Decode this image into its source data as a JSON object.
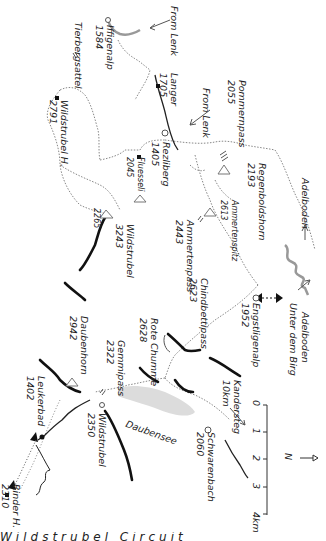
{
  "map": {
    "orientation": "rotated 90deg clockwise (north to the right)",
    "places": [
      {
        "name": "Iffigenalp",
        "elevation": "1584",
        "x": 118,
        "y": 25
      },
      {
        "name": "Langer",
        "elevation": "1705",
        "x": 178,
        "y": 74
      },
      {
        "name": "Tierbergsattel",
        "elevation": "",
        "x": 83,
        "y": 22
      },
      {
        "name": "Wildstrubel H.",
        "elevation": "2791",
        "x": 67,
        "y": 100
      },
      {
        "name": "Rezliberg",
        "elevation": "1405",
        "x": 170,
        "y": 144
      },
      {
        "name": "Fluesseli",
        "elevation": "2045",
        "x": 141,
        "y": 157
      },
      {
        "name": "Pommernpass",
        "elevation": "2055",
        "x": 246,
        "y": 80
      },
      {
        "name": "Regenboldshorn",
        "elevation": "2193",
        "x": 264,
        "y": 163
      },
      {
        "name": "Ammertenspitz",
        "elevation": "2613",
        "x": 240,
        "y": 198
      },
      {
        "name": "Ammertenpass",
        "elevation": "2443",
        "x": 196,
        "y": 218
      },
      {
        "name": "Wildstrubel",
        "elevation": "3243",
        "x": 135,
        "y": 225
      },
      {
        "name": "Chindbettipass",
        "elevation": "2623",
        "x": 205,
        "y": 278
      },
      {
        "name": "Rote Chumme",
        "elevation": "2628",
        "x": 163,
        "y": 322
      },
      {
        "name": "Engstligenalp",
        "elevation": "1952",
        "x": 263,
        "y": 297
      },
      {
        "name": "Unter dem Birg",
        "elevation": "",
        "x": 299,
        "y": 296
      },
      {
        "name": "Daubenhorn",
        "elevation": "2942",
        "x": 90,
        "y": 318
      },
      {
        "name": "Gemmipass",
        "elevation": "2322",
        "x": 127,
        "y": 340
      },
      {
        "name": "Leukerbad",
        "elevation": "1402",
        "x": 43,
        "y": 378
      },
      {
        "name": "Wildstrubel",
        "elevation": "2350",
        "x": 101,
        "y": 408
      },
      {
        "name": "Daubensee",
        "elevation": "",
        "x": 123,
        "y": 420
      },
      {
        "name": "Schwarenbach",
        "elevation": "2060",
        "x": 215,
        "y": 432
      },
      {
        "name": "Rinder H.",
        "elevation": "2310",
        "x": 20,
        "y": 485
      },
      {
        "name": "2265",
        "elevation": "",
        "x": 98,
        "y": 155
      }
    ],
    "directions": [
      {
        "label": "From Lenk",
        "x": 163,
        "y": 10
      },
      {
        "label": "From Lenk",
        "x": 211,
        "y": 90
      },
      {
        "label": "Adelboden",
        "x": 310,
        "y": 180
      },
      {
        "label": "Adelboden",
        "x": 310,
        "y": 315
      },
      {
        "label": "Kandersteg",
        "sub": "10km",
        "x": 239,
        "y": 380
      }
    ],
    "scale": {
      "ticks": [
        "0",
        "1",
        "2",
        "3",
        "4km"
      ],
      "north_label": "N"
    },
    "caption": "Wildstrubel Circuit map"
  },
  "labels": {
    "iffigenalp": "Iffigenalp",
    "iffigenalp_el": "1584",
    "tierbergsattel": "Tierbergsattel",
    "wildstrubel_h": "Wildstrubel H.",
    "wildstrubel_h_el": "2791",
    "from_lenk_1": "From Lenk",
    "from_lenk_2": "From Lenk",
    "langer": "Langer",
    "langer_el": "1705",
    "pommernpass": "Pommernpass",
    "pommernpass_el": "2055",
    "rezliberg": "Rezliberg",
    "rezliberg_el": "1405",
    "fluesseli": "Fluesseli",
    "fluesseli_el": "2045",
    "p2265": "2265",
    "regenboldshorn": "Regenboldshorn",
    "regenboldshorn_el": "2193",
    "ammertenspitz": "Ammertenspitz",
    "ammertenspitz_el": "2613",
    "ammertenpass": "Ammertenpass",
    "ammertenpass_el": "2443",
    "wildstrubel": "Wildstrubel",
    "wildstrubel_el": "3243",
    "adelboden_1": "Adelboden",
    "adelboden_2": "Adelboden",
    "unter_dem_birg": "Unter dem Birg",
    "engstligenalp": "Engstligenalp",
    "engstligenalp_el": "1952",
    "chindbettipass": "Chindbettipass",
    "chindbettipass_el": "2623",
    "rote_chumme": "Rote Chumme",
    "rote_chumme_el": "2628",
    "daubenhorn": "Daubenhorn",
    "daubenhorn_el": "2942",
    "gemmipass": "Gemmipass",
    "gemmipass_el": "2322",
    "kandersteg": "Kandersteg",
    "kandersteg_dist": "10km",
    "leukerbad": "Leukerbad",
    "leukerbad_el": "1402",
    "wildstrubel2": "Wildstrubel",
    "wildstrubel2_el": "2350",
    "daubensee": "Daubensee",
    "schwarenbach": "Schwarenbach",
    "schwarenbach_el": "2060",
    "rinder_h": "Rinder H.",
    "rinder_h_el": "2310",
    "scale_0": "0",
    "scale_1": "1",
    "scale_2": "2",
    "scale_3": "3",
    "scale_4": "4km",
    "north": "N",
    "caption": "Wildstrubel Circuit map"
  }
}
